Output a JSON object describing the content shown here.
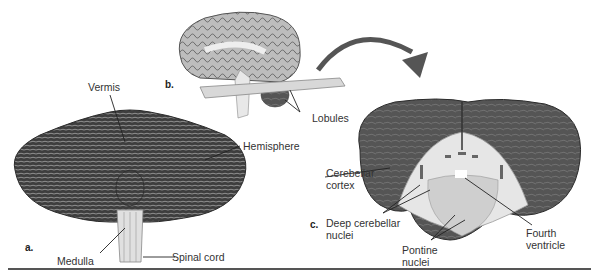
{
  "figure": {
    "panels": [
      {
        "letter": "a.",
        "subject": "cerebellum-posterior-view",
        "labels": [
          "Vermis",
          "Hemisphere",
          "Medulla",
          "Spinal cord"
        ]
      },
      {
        "letter": "b.",
        "subject": "brain-sagittal-with-section-plane",
        "labels": [
          "Lobules"
        ]
      },
      {
        "letter": "c.",
        "subject": "cerebellum-cross-section",
        "labels": [
          "Cerebellar cortex",
          "Deep cerebellar nuclei",
          "Pontine nuclei",
          "Fourth ventricle"
        ]
      }
    ],
    "text": {
      "vermis": "Vermis",
      "hemisphere": "Hemisphere",
      "medulla": "Medulla",
      "spinal_cord": "Spinal cord",
      "lobules": "Lobules",
      "cerebellar_l1": "Cerebellar",
      "cerebellar_l2": "cortex",
      "deep_l1": "Deep cerebellar",
      "deep_l2": "nuclei",
      "pontine_l1": "Pontine",
      "pontine_l2": "nuclei",
      "fourth_l1": "Fourth",
      "fourth_l2": "ventricle",
      "letter_a": "a.",
      "letter_b": "b.",
      "letter_c": "c."
    },
    "colors": {
      "tissue_dark": "#4a4a4a",
      "tissue_mid": "#7a7a7a",
      "white_matter": "#e6e6e6",
      "brainstem": "#cfcfcf",
      "plane": "#d8d8d8",
      "arrow": "#555555",
      "leader": "#222222"
    }
  }
}
